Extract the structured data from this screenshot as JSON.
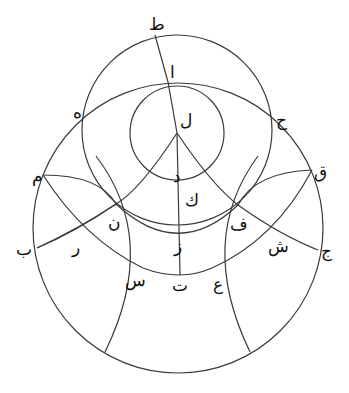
{
  "diagram": {
    "type": "geometric-construction",
    "stroke_color": "#3a3a3a",
    "background": "#ffffff",
    "labels": [
      {
        "id": "ta",
        "text": "ط",
        "x": 149,
        "y": 30
      },
      {
        "id": "alif",
        "text": "ا",
        "x": 170,
        "y": 78
      },
      {
        "id": "lam",
        "text": "ل",
        "x": 180,
        "y": 126
      },
      {
        "id": "ha",
        "text": "ه",
        "x": 73,
        "y": 118
      },
      {
        "id": "haa",
        "text": "ح",
        "x": 276,
        "y": 126
      },
      {
        "id": "mim",
        "text": "م",
        "x": 32,
        "y": 182
      },
      {
        "id": "qaf",
        "text": "ق",
        "x": 314,
        "y": 178
      },
      {
        "id": "dal",
        "text": "د",
        "x": 173,
        "y": 182
      },
      {
        "id": "kaf",
        "text": "ك",
        "x": 185,
        "y": 206
      },
      {
        "id": "nun",
        "text": "ن",
        "x": 108,
        "y": 228
      },
      {
        "id": "fa",
        "text": "ف",
        "x": 230,
        "y": 230
      },
      {
        "id": "ra",
        "text": "ر",
        "x": 72,
        "y": 253
      },
      {
        "id": "ba",
        "text": "ب",
        "x": 16,
        "y": 255
      },
      {
        "id": "zay",
        "text": "ز",
        "x": 174,
        "y": 252
      },
      {
        "id": "shin",
        "text": "ش",
        "x": 268,
        "y": 252
      },
      {
        "id": "jim",
        "text": "ج",
        "x": 321,
        "y": 257
      },
      {
        "id": "sin",
        "text": "س",
        "x": 125,
        "y": 286
      },
      {
        "id": "tha",
        "text": "ت",
        "x": 172,
        "y": 291
      },
      {
        "id": "ayn",
        "text": "ع",
        "x": 213,
        "y": 290
      }
    ],
    "circles": [
      {
        "id": "outer-circle",
        "cx": 178,
        "cy": 228,
        "r": 145
      },
      {
        "id": "upper-circle",
        "cx": 177,
        "cy": 130,
        "r": 95
      },
      {
        "id": "inner-circle",
        "cx": 177,
        "cy": 133,
        "r": 47
      }
    ]
  }
}
